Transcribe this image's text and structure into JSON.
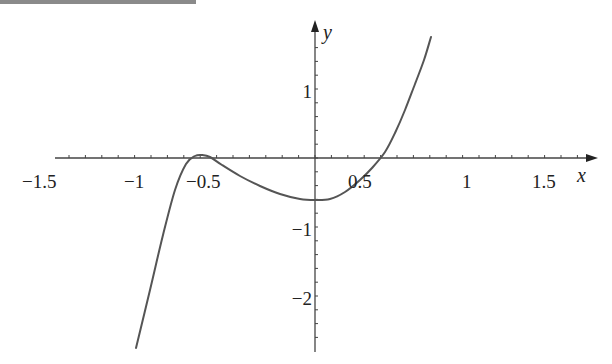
{
  "chart_data": {
    "type": "line",
    "title": "",
    "xlabel": "x",
    "ylabel": "y",
    "xlim": [
      -1.5,
      1.8
    ],
    "ylim": [
      -2.75,
      1.75
    ],
    "grid": false,
    "legend": null,
    "x_ticks": [
      "-1.5",
      "-1",
      "-0.5",
      "0.5",
      "1",
      "1.5"
    ],
    "y_ticks": [
      "1",
      "-1",
      "-2"
    ],
    "series": [
      {
        "name": "curve",
        "color": "#555555",
        "points_px": [
          [
            136,
            348
          ],
          [
            150,
            290
          ],
          [
            163,
            235
          ],
          [
            175,
            190
          ],
          [
            186,
            164
          ],
          [
            195,
            156
          ],
          [
            202,
            155
          ],
          [
            210,
            157
          ],
          [
            222,
            165
          ],
          [
            240,
            176
          ],
          [
            260,
            186
          ],
          [
            280,
            194
          ],
          [
            300,
            199
          ],
          [
            315,
            200
          ],
          [
            330,
            199
          ],
          [
            345,
            192
          ],
          [
            360,
            180
          ],
          [
            372,
            168
          ],
          [
            385,
            152
          ],
          [
            395,
            133
          ],
          [
            405,
            110
          ],
          [
            415,
            84
          ],
          [
            424,
            60
          ],
          [
            431,
            37
          ]
        ],
        "features": {
          "local_max": {
            "x": -0.55,
            "y": 0.05
          },
          "local_min": {
            "x": 0.0,
            "y": -1.0
          },
          "x_intercepts": [
            -0.65,
            -0.45,
            0.58
          ]
        }
      }
    ]
  },
  "labels": {
    "x_axis_name": "x",
    "y_axis_name": "y",
    "x_ticks": [
      {
        "text": "−1.5",
        "left": 22
      },
      {
        "text": "−1",
        "left": 124
      },
      {
        "text": "−0.5",
        "left": 186
      },
      {
        "text": "0.5",
        "left": 348
      },
      {
        "text": "1",
        "left": 462
      },
      {
        "text": "1.5",
        "left": 532
      }
    ],
    "y_ticks": [
      {
        "text": "1",
        "top": 82
      },
      {
        "text": "−1",
        "top": 220
      },
      {
        "text": "−2",
        "top": 289
      }
    ]
  }
}
